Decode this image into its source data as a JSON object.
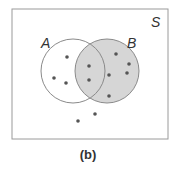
{
  "diagram": {
    "type": "venn",
    "universe_label": "S",
    "caption": "(b)",
    "sets": [
      {
        "label": "A",
        "cx": 73,
        "cy": 71,
        "r": 32,
        "shaded": false
      },
      {
        "label": "B",
        "cx": 107,
        "cy": 71,
        "r": 32,
        "shaded": true
      }
    ],
    "shade_color": "#d6d6d6",
    "points": {
      "A_only": [
        [
          67,
          57
        ],
        [
          54,
          78
        ],
        [
          66,
          83
        ]
      ],
      "A_and_B": [
        [
          89,
          66
        ],
        [
          89,
          80
        ]
      ],
      "B_only": [
        [
          116,
          54
        ],
        [
          129,
          64
        ],
        [
          127,
          73
        ],
        [
          109,
          75
        ],
        [
          109,
          96
        ]
      ],
      "outside": [
        [
          95,
          114
        ],
        [
          78,
          121
        ]
      ]
    },
    "point_color": "#555555"
  }
}
